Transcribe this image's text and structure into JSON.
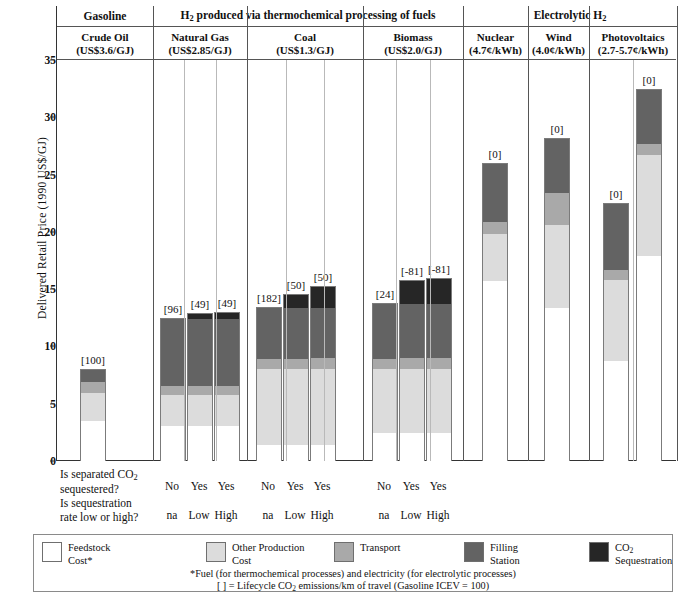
{
  "axis": {
    "ylabel": "Delivered Retail Price (1990 US$/GJ)",
    "ticks": [
      "0",
      "5",
      "10",
      "15",
      "20",
      "25",
      "30",
      "35"
    ]
  },
  "groups": [
    {
      "title": "Gasoline",
      "sub_name": "Crude Oil",
      "sub_price": "(US$3.6/GJ)"
    },
    {
      "title": "H2 produced via thermochemical processing of fuels",
      "sub_name": "Natural Gas",
      "sub_price": "(US$2.85/GJ)"
    },
    {
      "sub_name": "Coal",
      "sub_price": "(US$1.3/GJ)"
    },
    {
      "sub_name": "Biomass",
      "sub_price": "(US$2.0/GJ)"
    },
    {
      "title": "Electrolytic H2",
      "sub_name": "Nuclear",
      "sub_price": "(4.7¢/kWh)"
    },
    {
      "sub_name": "Wind",
      "sub_price": "(4.0¢/kWh)"
    },
    {
      "sub_name": "Photovoltaics",
      "sub_price": "(2.7-5.7¢/kWh)"
    }
  ],
  "questions": {
    "q1_line1": "Is separated CO2",
    "q1_line2": "sequestered?",
    "q2_line1": "Is sequestration",
    "q2_line2": "rate low or high?",
    "answers_q1": [
      "No",
      "Yes",
      "Yes",
      "No",
      "Yes",
      "Yes",
      "No",
      "Yes",
      "Yes"
    ],
    "answers_q2": [
      "na",
      "Low",
      "High",
      "na",
      "Low",
      "High",
      "na",
      "Low",
      "High"
    ]
  },
  "legend": {
    "items": [
      {
        "name": "feedstock-cost",
        "label_line1": "Feedstock",
        "label_line2": "Cost*",
        "color": "#ffffff"
      },
      {
        "name": "other-production-cost",
        "label_line1": "Other Production",
        "label_line2": "Cost",
        "color": "#dcdcdc"
      },
      {
        "name": "transport",
        "label_line1": "Transport",
        "label_line2": "",
        "color": "#a9a9a9"
      },
      {
        "name": "filling-station",
        "label_line1": "Filling",
        "label_line2": "Station",
        "color": "#636363"
      },
      {
        "name": "co2-sequestration",
        "label_line1": "CO2",
        "label_line2": "Sequestration",
        "color": "#262626"
      }
    ],
    "footnote1": "*Fuel (for thermochemical processes) and electricity (for electrolytic processes)",
    "footnote2": "[ ] = Lifecycle CO2 emissions/km of travel (Gasoline ICEV = 100)"
  },
  "chart_data": {
    "type": "bar",
    "xlabel": "",
    "ylabel": "Delivered Retail Price (1990 US$/GJ)",
    "ylim": [
      0,
      35
    ],
    "ytick_step": 5,
    "grid": false,
    "stacked": true,
    "legend_position": "bottom",
    "series": [
      {
        "name": "Feedstock Cost*",
        "color": "#ffffff"
      },
      {
        "name": "Other Production Cost",
        "color": "#dcdcdc"
      },
      {
        "name": "Transport",
        "color": "#a9a9a9"
      },
      {
        "name": "Filling Station",
        "color": "#636363"
      },
      {
        "name": "CO2 Sequestration",
        "color": "#262626"
      }
    ],
    "bars": [
      {
        "group": "Gasoline",
        "feedstock_label": "Crude Oil",
        "feedstock_price": "US$3.6/GJ",
        "sequestered": "",
        "seq_rate": "",
        "emissions_index": "[100]",
        "feedstock": 3.5,
        "other_production": 2.5,
        "transport": 1.0,
        "filling_station": 1.0,
        "co2_sequestration": 0,
        "total": 8.0
      },
      {
        "group": "Natural Gas",
        "sequestered": "No",
        "seq_rate": "na",
        "emissions_index": "[96]",
        "feedstock": 3.1,
        "other_production": 2.7,
        "transport": 0.8,
        "filling_station": 5.9,
        "co2_sequestration": 0,
        "total": 12.5
      },
      {
        "group": "Natural Gas",
        "sequestered": "Yes",
        "seq_rate": "Low",
        "emissions_index": "[49]",
        "feedstock": 3.1,
        "other_production": 2.7,
        "transport": 0.8,
        "filling_station": 5.9,
        "co2_sequestration": 0.4,
        "total": 12.9
      },
      {
        "group": "Natural Gas",
        "sequestered": "Yes",
        "seq_rate": "High",
        "emissions_index": "[49]",
        "feedstock": 3.1,
        "other_production": 2.7,
        "transport": 0.8,
        "filling_station": 5.9,
        "co2_sequestration": 0.5,
        "total": 13.0
      },
      {
        "group": "Coal",
        "sequestered": "No",
        "seq_rate": "na",
        "emissions_index": "[182]",
        "feedstock": 1.4,
        "other_production": 6.7,
        "transport": 0.9,
        "filling_station": 4.4,
        "co2_sequestration": 0,
        "total": 13.4
      },
      {
        "group": "Coal",
        "sequestered": "Yes",
        "seq_rate": "Low",
        "emissions_index": "[50]",
        "feedstock": 1.4,
        "other_production": 6.7,
        "transport": 0.9,
        "filling_station": 4.4,
        "co2_sequestration": 1.2,
        "total": 14.6
      },
      {
        "group": "Coal",
        "sequestered": "Yes",
        "seq_rate": "High",
        "emissions_index": "[50]",
        "feedstock": 1.4,
        "other_production": 6.7,
        "transport": 0.9,
        "filling_station": 4.4,
        "co2_sequestration": 1.9,
        "total": 15.3
      },
      {
        "group": "Biomass",
        "sequestered": "No",
        "seq_rate": "na",
        "emissions_index": "[24]",
        "feedstock": 2.5,
        "other_production": 5.6,
        "transport": 0.9,
        "filling_station": 4.8,
        "co2_sequestration": 0,
        "total": 13.8
      },
      {
        "group": "Biomass",
        "sequestered": "Yes",
        "seq_rate": "Low",
        "emissions_index": "[-81]",
        "feedstock": 2.5,
        "other_production": 5.6,
        "transport": 0.9,
        "filling_station": 4.8,
        "co2_sequestration": 2.0,
        "total": 15.8
      },
      {
        "group": "Biomass",
        "sequestered": "Yes",
        "seq_rate": "High",
        "emissions_index": "[-81]",
        "feedstock": 2.5,
        "other_production": 5.6,
        "transport": 0.9,
        "filling_station": 4.8,
        "co2_sequestration": 2.2,
        "total": 16.0
      },
      {
        "group": "Nuclear",
        "sequestered": "",
        "seq_rate": "",
        "emissions_index": "[0]",
        "feedstock": 15.8,
        "other_production": 4.1,
        "transport": 1.0,
        "filling_station": 5.1,
        "co2_sequestration": 0,
        "total": 26.0
      },
      {
        "group": "Wind",
        "sequestered": "",
        "seq_rate": "",
        "emissions_index": "[0]",
        "feedstock": 13.4,
        "other_production": 7.3,
        "transport": 2.8,
        "filling_station": 4.7,
        "co2_sequestration": 0,
        "total": 28.2
      },
      {
        "group": "Photovoltaics-low",
        "sequestered": "",
        "seq_rate": "",
        "emissions_index": "[0]",
        "feedstock": 8.8,
        "other_production": 7.1,
        "transport": 0.8,
        "filling_station": 5.8,
        "co2_sequestration": 0,
        "total": 22.5
      },
      {
        "group": "Photovoltaics-high",
        "sequestered": "",
        "seq_rate": "",
        "emissions_index": "[0]",
        "feedstock": 17.9,
        "other_production": 8.9,
        "transport": 0.9,
        "filling_station": 4.8,
        "co2_sequestration": 0,
        "total": 32.5
      }
    ]
  }
}
